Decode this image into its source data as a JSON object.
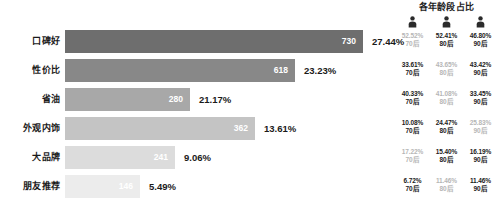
{
  "age_panel": {
    "title": "各年龄段占比",
    "icon_name": "person-icon",
    "groups": [
      "70后",
      "80后",
      "90后"
    ]
  },
  "chart_data": {
    "type": "bar",
    "orientation": "horizontal",
    "title": "",
    "xlabel": "",
    "ylabel": "",
    "categories": [
      "口碑好",
      "性价比",
      "省油",
      "外观内饰",
      "大品牌",
      "朋友推荐"
    ],
    "values": [
      730,
      618,
      280,
      362,
      241,
      146
    ],
    "percents": [
      "27.44%",
      "23.23%",
      "21.17%",
      "13.61%",
      "9.06%",
      "5.49%"
    ],
    "bar_colors": [
      "#6e6e6e",
      "#888888",
      "#a8a8a8",
      "#c4c4c4",
      "#dcdcdc",
      "#ececec"
    ],
    "bar_widths_px": [
      298,
      230,
      125,
      190,
      110,
      75
    ],
    "age_groups": [
      "70后",
      "80后",
      "90后"
    ],
    "series": [
      {
        "name": "70后",
        "values": [
          "52.52%",
          "33.61%",
          "40.33%",
          "10.08%",
          "17.22%",
          "6.72%"
        ]
      },
      {
        "name": "80后",
        "values": [
          "52.41%",
          "43.65%",
          "41.08%",
          "24.47%",
          "15.40%",
          "11.46%"
        ]
      },
      {
        "name": "90后",
        "values": [
          "46.80%",
          "43.42%",
          "33.45%",
          "25.83%",
          "16.19%",
          "11.46%"
        ]
      }
    ],
    "age_color_strong": "#1a1a1a",
    "age_color_weak": "#b6b6b6"
  },
  "rows": [
    {
      "label": "口碑好",
      "value": "730",
      "percent": "27.44%",
      "ages": [
        {
          "pct": "52.52%",
          "group": "70后",
          "dim": true
        },
        {
          "pct": "52.41%",
          "group": "80后",
          "dim": false
        },
        {
          "pct": "46.80%",
          "group": "90后",
          "dim": false
        }
      ]
    },
    {
      "label": "性价比",
      "value": "618",
      "percent": "23.23%",
      "ages": [
        {
          "pct": "33.61%",
          "group": "70后",
          "dim": false
        },
        {
          "pct": "43.65%",
          "group": "80后",
          "dim": true
        },
        {
          "pct": "43.42%",
          "group": "90后",
          "dim": false
        }
      ]
    },
    {
      "label": "省油",
      "value": "280",
      "percent": "21.17%",
      "ages": [
        {
          "pct": "40.33%",
          "group": "70后",
          "dim": false
        },
        {
          "pct": "41.08%",
          "group": "80后",
          "dim": true
        },
        {
          "pct": "33.45%",
          "group": "90后",
          "dim": false
        }
      ]
    },
    {
      "label": "外观内饰",
      "value": "362",
      "percent": "13.61%",
      "ages": [
        {
          "pct": "10.08%",
          "group": "70后",
          "dim": false
        },
        {
          "pct": "24.47%",
          "group": "80后",
          "dim": false
        },
        {
          "pct": "25.83%",
          "group": "90后",
          "dim": true
        }
      ]
    },
    {
      "label": "大品牌",
      "value": "241",
      "percent": "9.06%",
      "ages": [
        {
          "pct": "17.22%",
          "group": "70后",
          "dim": true
        },
        {
          "pct": "15.40%",
          "group": "80后",
          "dim": false
        },
        {
          "pct": "16.19%",
          "group": "90后",
          "dim": false
        }
      ]
    },
    {
      "label": "朋友推荐",
      "value": "146",
      "percent": "5.49%",
      "ages": [
        {
          "pct": "6.72%",
          "group": "70后",
          "dim": false
        },
        {
          "pct": "11.46%",
          "group": "80后",
          "dim": true
        },
        {
          "pct": "11.46%",
          "group": "90后",
          "dim": false
        }
      ]
    }
  ]
}
